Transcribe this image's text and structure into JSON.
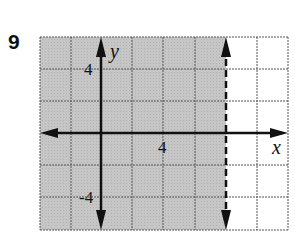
{
  "problem": {
    "number": "9"
  },
  "graph": {
    "x_axis_label": "x",
    "y_axis_label": "y",
    "tick_labels": {
      "x_pos": "4",
      "y_pos": "4",
      "y_neg": "-4"
    },
    "grid": {
      "cols": 8,
      "rows": 6,
      "units_per_cell": 2
    },
    "boundary": {
      "type": "vertical",
      "style": "dashed",
      "x": 8
    },
    "shading": {
      "region": "left of boundary",
      "color": "#c4c4c4"
    },
    "colors": {
      "shade": "#c4c4c4",
      "grid": "#555555",
      "axis": "#111111",
      "background": "#ffffff"
    }
  }
}
